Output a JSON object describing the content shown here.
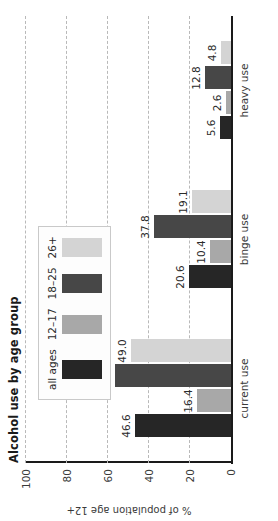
{
  "chart_data": {
    "type": "bar",
    "title": "Alcohol use by age group",
    "xlabel": "",
    "ylabel": "% of population age 12+",
    "ylim": [
      0,
      100
    ],
    "yticks": [
      "0",
      "20",
      "40",
      "60",
      "80",
      "100"
    ],
    "grid": true,
    "legend_position": "top-left-inside",
    "categories": [
      "current use",
      "binge use",
      "heavy use"
    ],
    "series": [
      {
        "name": "all ages",
        "color": "#262626",
        "values": [
          46.6,
          20.6,
          5.6
        ],
        "labels": [
          "46.6",
          "20.6",
          "5.6"
        ]
      },
      {
        "name": "12–17",
        "color": "#a8a8a8",
        "values": [
          16.4,
          10.4,
          2.6
        ],
        "labels": [
          "16.4",
          "10.4",
          "2.6"
        ]
      },
      {
        "name": "18–25",
        "color": "#474747",
        "values": [
          56.8,
          37.8,
          12.8
        ],
        "labels": [
          "56.8",
          "37.8",
          "12.8"
        ]
      },
      {
        "name": "26+",
        "color": "#d4d4d4",
        "values": [
          49.0,
          19.1,
          4.8
        ],
        "labels": [
          "49.0",
          "19.1",
          "4.8"
        ]
      }
    ]
  },
  "figure": {
    "rotation_note": "",
    "background": "#ffffff",
    "grid_color": "#b9b9b9",
    "axis_color": "#1a1a1a",
    "text_color": "#3a3a3a"
  }
}
